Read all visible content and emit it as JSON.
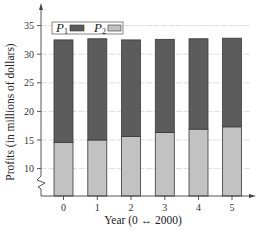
{
  "chart_data": {
    "type": "bar",
    "stacked": true,
    "title": "",
    "xlabel": "Year (0 ↔ 2000)",
    "ylabel": "Profits (in millions of dollars)",
    "categories": [
      "0",
      "1",
      "2",
      "3",
      "4",
      "5"
    ],
    "series": [
      {
        "name": "P1",
        "values": [
          32.5,
          32.7,
          32.5,
          32.6,
          32.7,
          32.8
        ],
        "color": "#5c5c5c",
        "note": "total height of stacked bar (P1 top segment)"
      },
      {
        "name": "P2",
        "values": [
          14.6,
          15.0,
          15.6,
          16.3,
          16.9,
          17.3
        ],
        "color": "#c2c2c2"
      }
    ],
    "ylim": [
      6,
      36
    ],
    "yticks": [
      10,
      15,
      20,
      25,
      30,
      35
    ],
    "axis_break": true,
    "grid": "horizontal",
    "legend_position": "top-left inside"
  },
  "legend": {
    "items": [
      {
        "label": "P",
        "sub": "1",
        "color": "#5c5c5c"
      },
      {
        "label": "P",
        "sub": "2",
        "color": "#c2c2c2"
      }
    ]
  },
  "axes": {
    "xlabel": "Year (0 ↔ 2000)",
    "ylabel": "Profits (in millions of dollars)",
    "ytick_labels": [
      "35",
      "30",
      "25",
      "20",
      "15",
      "10"
    ],
    "xtick_labels": [
      "0",
      "1",
      "2",
      "3",
      "4",
      "5"
    ]
  },
  "colors": {
    "dark": "#5c5c5c",
    "light": "#c2c2c2",
    "outline": "#3a3a3a",
    "grid": "#d8d8d8",
    "axis": "#444444"
  }
}
